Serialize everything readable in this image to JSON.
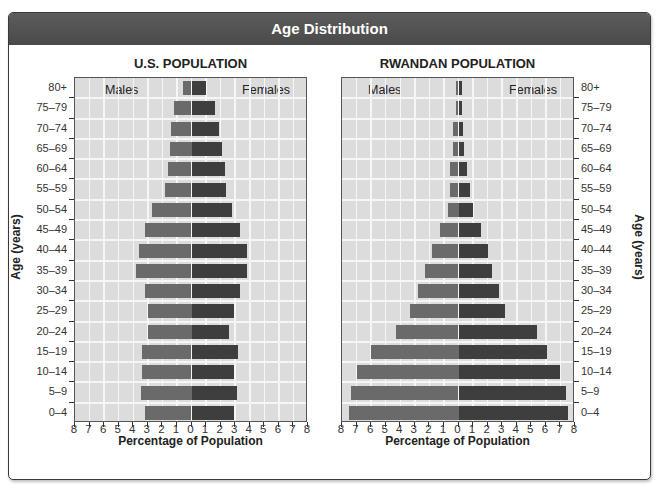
{
  "header": {
    "title": "Age Distribution"
  },
  "panels": [
    {
      "title": "U.S. POPULATION",
      "males_label": "Males",
      "females_label": "Females"
    },
    {
      "title": "RWANDAN POPULATION",
      "males_label": "Males",
      "females_label": "Females"
    }
  ],
  "axes": {
    "x_title": "Percentage of Population",
    "y_title": "Age (years)",
    "x_ticks": [
      "8",
      "7",
      "6",
      "5",
      "4",
      "3",
      "2",
      "1",
      "0",
      "1",
      "2",
      "3",
      "4",
      "5",
      "6",
      "7",
      "8"
    ],
    "age_groups": [
      "80+",
      "75–79",
      "70–74",
      "65–69",
      "60–64",
      "55–59",
      "50–54",
      "45–49",
      "40–44",
      "35–39",
      "30–34",
      "25–29",
      "20–24",
      "15–19",
      "10–14",
      "5–9",
      "0–4"
    ]
  },
  "colors": {
    "male": "#6a6a6a",
    "female": "#3e3e3e",
    "plot_bg": "#dcdcdc",
    "grid": "#f6f6f6",
    "header_bg": "#4f4f4f"
  },
  "chart_data": [
    {
      "type": "bar",
      "subtype": "population-pyramid",
      "title": "U.S. POPULATION",
      "xlabel": "Percentage of Population",
      "ylabel": "Age (years)",
      "xlim": [
        -8,
        8
      ],
      "grid": true,
      "categories": [
        "80+",
        "75–79",
        "70–74",
        "65–69",
        "60–64",
        "55–59",
        "50–54",
        "45–49",
        "40–44",
        "35–39",
        "30–34",
        "25–29",
        "20–24",
        "15–19",
        "10–14",
        "5–9",
        "0–4"
      ],
      "series": [
        {
          "name": "Males",
          "values": [
            0.6,
            1.2,
            1.4,
            1.5,
            1.6,
            1.8,
            2.7,
            3.2,
            3.6,
            3.8,
            3.2,
            3.0,
            3.0,
            3.4,
            3.4,
            3.5,
            3.2
          ]
        },
        {
          "name": "Females",
          "values": [
            1.0,
            1.6,
            1.9,
            2.1,
            2.3,
            2.4,
            2.8,
            3.3,
            3.8,
            3.8,
            3.3,
            2.9,
            2.6,
            3.2,
            2.9,
            3.1,
            2.9
          ]
        }
      ],
      "legend": [
        "Males (left)",
        "Females (right)"
      ]
    },
    {
      "type": "bar",
      "subtype": "population-pyramid",
      "title": "RWANDAN POPULATION",
      "xlabel": "Percentage of Population",
      "ylabel": "Age (years)",
      "xlim": [
        -8,
        8
      ],
      "grid": true,
      "categories": [
        "80+",
        "75–79",
        "70–74",
        "65–69",
        "60–64",
        "55–59",
        "50–54",
        "45–49",
        "40–44",
        "35–39",
        "30–34",
        "25–29",
        "20–24",
        "15–19",
        "10–14",
        "5–9",
        "0–4"
      ],
      "series": [
        {
          "name": "Males",
          "values": [
            0.15,
            0.2,
            0.35,
            0.4,
            0.55,
            0.6,
            0.75,
            1.3,
            1.8,
            2.3,
            2.8,
            3.3,
            4.3,
            6.0,
            7.0,
            7.4,
            7.5
          ]
        },
        {
          "name": "Females",
          "values": [
            0.25,
            0.25,
            0.3,
            0.4,
            0.6,
            0.8,
            1.0,
            1.55,
            2.0,
            2.3,
            2.8,
            3.2,
            5.4,
            6.1,
            7.0,
            7.4,
            7.5
          ]
        }
      ],
      "legend": [
        "Males (left)",
        "Females (right)"
      ]
    }
  ]
}
